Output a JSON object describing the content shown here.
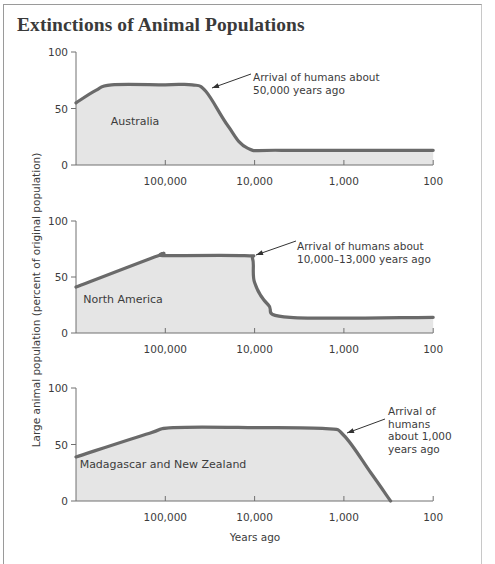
{
  "chart_data": {
    "type": "area",
    "title": "Extinctions of Animal Populations",
    "xlabel": "Years ago",
    "ylabel": "Large animal population (percent of original population)",
    "x_scale": "log (reversed, years before present)",
    "x_ticks": [
      100000,
      10000,
      1000,
      100
    ],
    "x_tick_labels": [
      "100,000",
      "10,000",
      "1,000",
      "100"
    ],
    "x_range": [
      1000000,
      100
    ],
    "y_ticks": [
      0,
      50,
      100
    ],
    "y_range": [
      0,
      100
    ],
    "grid": false,
    "panels": [
      {
        "region": "Australia",
        "annotation": [
          "Arrival of humans about",
          "50,000 years ago"
        ],
        "points": [
          {
            "years_ago": 1000000,
            "percent": 55
          },
          {
            "years_ago": 600000,
            "percent": 66
          },
          {
            "years_ago": 400000,
            "percent": 71
          },
          {
            "years_ago": 100000,
            "percent": 71
          },
          {
            "years_ago": 50000,
            "percent": 71
          },
          {
            "years_ago": 35000,
            "percent": 65
          },
          {
            "years_ago": 20000,
            "percent": 35
          },
          {
            "years_ago": 12000,
            "percent": 15
          },
          {
            "years_ago": 5000,
            "percent": 13
          },
          {
            "years_ago": 100,
            "percent": 13
          }
        ]
      },
      {
        "region": "North America",
        "annotation": [
          "Arrival of humans about",
          "10,000–13,000 years ago"
        ],
        "points": [
          {
            "years_ago": 1000000,
            "percent": 41
          },
          {
            "years_ago": 120000,
            "percent": 69
          },
          {
            "years_ago": 100000,
            "percent": 69
          },
          {
            "years_ago": 13000,
            "percent": 69
          },
          {
            "years_ago": 10500,
            "percent": 66
          },
          {
            "years_ago": 10000,
            "percent": 45
          },
          {
            "years_ago": 7000,
            "percent": 25
          },
          {
            "years_ago": 4000,
            "percent": 14
          },
          {
            "years_ago": 100,
            "percent": 14
          }
        ]
      },
      {
        "region": "Madagascar and New Zealand",
        "annotation": [
          "Arrival of",
          "humans",
          "about 1,000",
          "years ago"
        ],
        "points": [
          {
            "years_ago": 1000000,
            "percent": 39
          },
          {
            "years_ago": 150000,
            "percent": 60
          },
          {
            "years_ago": 80000,
            "percent": 65
          },
          {
            "years_ago": 10000,
            "percent": 65
          },
          {
            "years_ago": 1600,
            "percent": 64
          },
          {
            "years_ago": 1000,
            "percent": 58
          },
          {
            "years_ago": 500,
            "percent": 25
          },
          {
            "years_ago": 300,
            "percent": 0
          }
        ]
      }
    ]
  },
  "colors": {
    "curve": "#6a6a6a",
    "fill": "#e5e5e5",
    "axis": "#707070",
    "text": "#3c3c3c"
  }
}
